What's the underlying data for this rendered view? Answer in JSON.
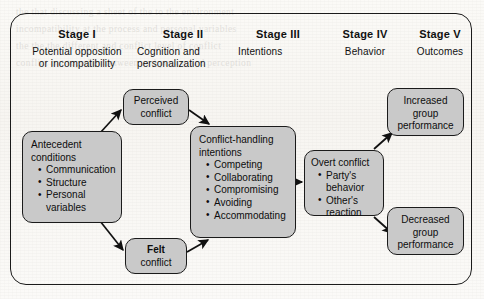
{
  "diagram": {
    "frame_color": "#1b1b1b",
    "node_fill": "#c9c9c9",
    "stages": [
      {
        "title": "Stage I",
        "subtitle": "Potential opposition\nor incompatibility"
      },
      {
        "title": "Stage II",
        "subtitle": "Cognition and\npersonalization"
      },
      {
        "title": "Stage III",
        "subtitle": "Intentions"
      },
      {
        "title": "Stage IV",
        "subtitle": "Behavior"
      },
      {
        "title": "Stage V",
        "subtitle": "Outcomes"
      }
    ],
    "nodes": {
      "antecedent": {
        "heading_line1": "Antecedent",
        "heading_line2": "conditions",
        "items": [
          "Communication",
          "Structure",
          "Personal"
        ],
        "item_wrap": "variables"
      },
      "perceived": {
        "line1": "Perceived",
        "line2": "conflict"
      },
      "felt": {
        "line1": "Felt",
        "line2": "conflict"
      },
      "intentions": {
        "heading_line1": "Conflict-handling",
        "heading_line2": "intentions",
        "items": [
          "Competing",
          "Collaborating",
          "Compromising",
          "Avoiding",
          "Accommodating"
        ]
      },
      "overt": {
        "heading": "Overt conflict",
        "items": [
          "Party's",
          "Other's"
        ],
        "item1_wrap": "behavior",
        "item2_wrap": "reaction"
      },
      "increased": {
        "line1": "Increased",
        "line2": "group",
        "line3": "performance"
      },
      "decreased": {
        "line1": "Decreased",
        "line2": "group",
        "line3": "performance"
      }
    },
    "ghost_text": "the that discussing a sheet of the to the environment\nincompatibility at the process and personal variables\nthe the the different and conflict level of conflict\nconflict but together between and person and perception"
  }
}
